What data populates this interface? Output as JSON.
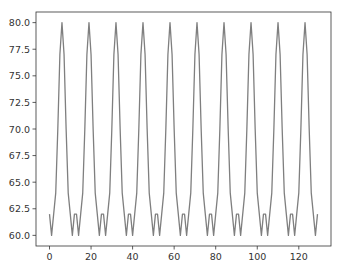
{
  "chart_data": {
    "type": "line",
    "title": "",
    "xlabel": "",
    "ylabel": "",
    "xlim": [
      -6.5,
      135.5
    ],
    "ylim": [
      59,
      81
    ],
    "grid": false,
    "legend": null,
    "x_ticks": [
      0,
      20,
      40,
      60,
      80,
      100,
      120
    ],
    "x_tick_labels": [
      "0",
      "20",
      "40",
      "60",
      "80",
      "100",
      "120"
    ],
    "y_ticks": [
      60.0,
      62.5,
      65.0,
      67.5,
      70.0,
      72.5,
      75.0,
      77.5,
      80.0
    ],
    "y_tick_labels": [
      "60.0",
      "62.5",
      "65.0",
      "67.5",
      "70.0",
      "72.5",
      "75.0",
      "77.5",
      "80.0"
    ],
    "series": [
      {
        "name": "series-0",
        "color": "#7f7f7f",
        "x_start": 0,
        "x_step": 1,
        "values": [
          62,
          60,
          62,
          64,
          70,
          77,
          80,
          77,
          70,
          64,
          62,
          60,
          62,
          62,
          60,
          62,
          64,
          70,
          77,
          80,
          77,
          70,
          64,
          62,
          60,
          62,
          62,
          60,
          62,
          64,
          70,
          77,
          80,
          77,
          70,
          64,
          62,
          60,
          62,
          62,
          60,
          62,
          64,
          70,
          77,
          80,
          77,
          70,
          64,
          62,
          60,
          62,
          62,
          60,
          62,
          64,
          70,
          77,
          80,
          77,
          70,
          64,
          62,
          60,
          62,
          62,
          60,
          62,
          64,
          70,
          77,
          80,
          77,
          70,
          64,
          62,
          60,
          62,
          62,
          60,
          62,
          64,
          70,
          77,
          80,
          77,
          70,
          64,
          62,
          60,
          62,
          62,
          60,
          62,
          64,
          70,
          77,
          80,
          77,
          70,
          64,
          62,
          60,
          62,
          62,
          60,
          62,
          64,
          70,
          77,
          80,
          77,
          70,
          64,
          62,
          60,
          62,
          62,
          60,
          62,
          64,
          70,
          77,
          80,
          77,
          70,
          64,
          62,
          60,
          62
        ]
      }
    ]
  }
}
